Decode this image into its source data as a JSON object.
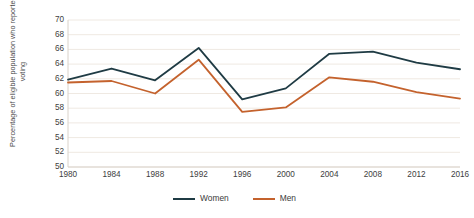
{
  "chart_data": {
    "type": "line",
    "title": "",
    "xlabel": "",
    "ylabel": "Percentage of eligible population who reported voting",
    "categories": [
      "1980",
      "1984",
      "1988",
      "1992",
      "1996",
      "2000",
      "2004",
      "2008",
      "2012",
      "2016"
    ],
    "series": [
      {
        "name": "Women",
        "color": "#1f3b44",
        "values": [
          61.9,
          63.4,
          61.8,
          66.2,
          59.2,
          60.7,
          65.4,
          65.7,
          64.2,
          63.3
        ]
      },
      {
        "name": "Men",
        "color": "#c4622d",
        "values": [
          61.5,
          61.7,
          60.0,
          64.6,
          57.5,
          58.1,
          62.2,
          61.6,
          60.2,
          59.3
        ]
      }
    ],
    "ylim": [
      50,
      70
    ],
    "ytick_step": 2,
    "yticks": [
      "70",
      "68",
      "66",
      "64",
      "62",
      "60",
      "58",
      "56",
      "54",
      "52",
      "50"
    ],
    "grid": true,
    "grid_color": "#efe9e2",
    "legend_position": "bottom"
  },
  "legend": {
    "items": [
      {
        "label": "Women",
        "color": "#1f3b44"
      },
      {
        "label": "Men",
        "color": "#c4622d"
      }
    ]
  }
}
